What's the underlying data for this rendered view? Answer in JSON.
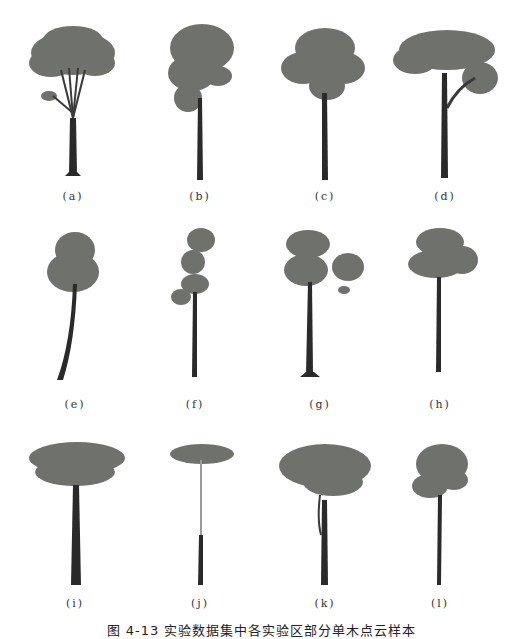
{
  "figure": {
    "caption": "图 4-13  实验数据集中各实验区部分单木点云样本",
    "colors": {
      "canopy": "#6e716c",
      "trunk": "#2a2a2a",
      "background": "#ffffff"
    },
    "panels": [
      {
        "id": "a",
        "label": "(a)"
      },
      {
        "id": "b",
        "label": "(b)"
      },
      {
        "id": "c",
        "label": "(c)"
      },
      {
        "id": "d",
        "label": "(d)"
      },
      {
        "id": "e",
        "label": "(e)"
      },
      {
        "id": "f",
        "label": "(f)"
      },
      {
        "id": "g",
        "label": "(g)"
      },
      {
        "id": "h",
        "label": "(h)"
      },
      {
        "id": "i",
        "label": "(i)"
      },
      {
        "id": "j",
        "label": "(j)"
      },
      {
        "id": "k",
        "label": "(k)"
      },
      {
        "id": "l",
        "label": "(l)"
      }
    ]
  }
}
